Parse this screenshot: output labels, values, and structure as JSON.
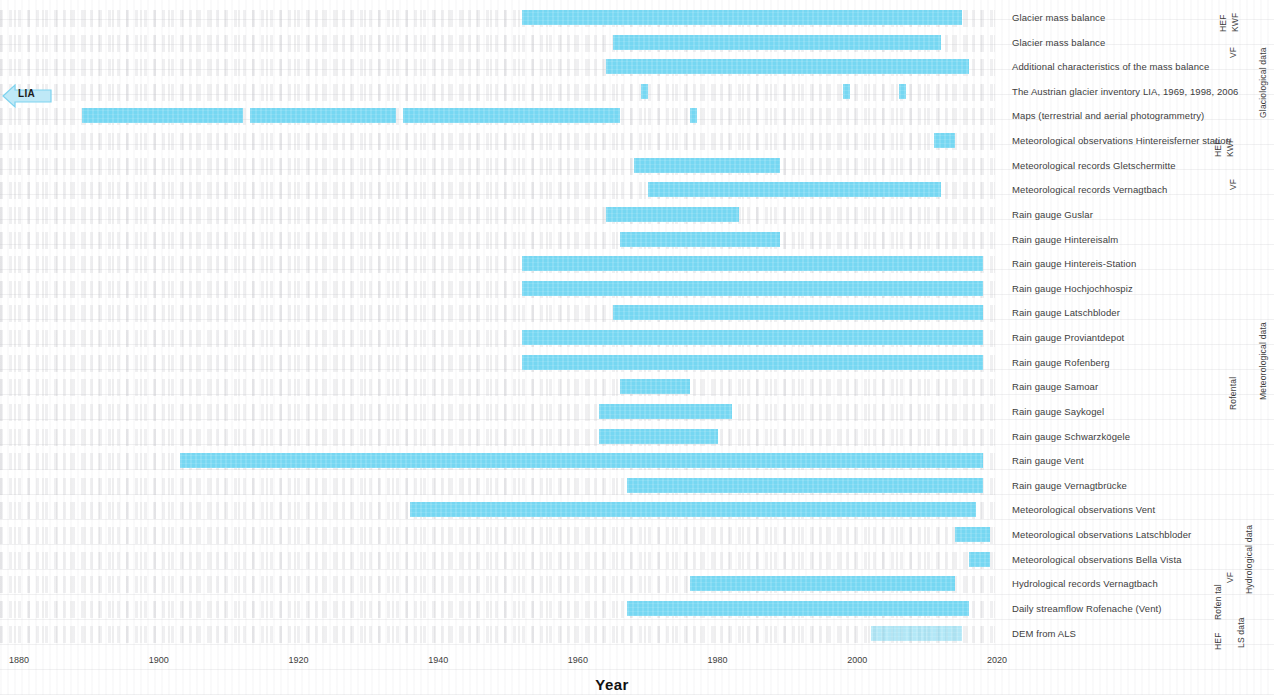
{
  "chart_data": {
    "type": "bar",
    "subtype": "timeline-gantt",
    "title": "",
    "xlabel": "Year",
    "ylabel": "",
    "xlim": [
      1876,
      2022
    ],
    "xticks": [
      1880,
      1900,
      1920,
      1940,
      1960,
      1980,
      2000,
      2020
    ],
    "grid": false,
    "bar_color": "#76d7f2",
    "annotations": [
      {
        "name": "lia-marker",
        "label": "LIA",
        "x_px": 2,
        "y_px": 83,
        "shape": "left-pointing-arrow-tag"
      }
    ],
    "categories": [
      "Glacier mass balance",
      "Glacier mass balance",
      "Additional characteristics of the mass balance",
      "The Austrian glacier inventory LIA, 1969, 1998, 2006",
      "Maps (terrestrial and aerial photogrammetry)",
      "Meteorological observations Hintereisferner station",
      "Meteorological records Gletschermitte",
      "Meteorological records Vernagtbach",
      "Rain gauge Guslar",
      "Rain gauge Hintereisalm",
      "Rain gauge Hintereis-Station",
      "Rain gauge Hochjochhospiz",
      "Rain gauge Latschbloder",
      "Rain gauge Proviantdepot",
      "Rain gauge Rofenberg",
      "Rain gauge Samoar",
      "Rain gauge Saykogel",
      "Rain gauge Schwarzkögele",
      "Rain gauge Vent",
      "Rain gauge Vernagtbrücke",
      "Meteorological observations Vent",
      "Meteorological observations Latschbloder",
      "Meteorological observations Bella Vista",
      "Hydrological records Vernagtbach",
      "Daily streamflow Rofenache (Vent)",
      "DEM from ALS"
    ],
    "rows": [
      {
        "label": "Glacier mass balance",
        "spans": [
          [
            1952,
            2015
          ]
        ]
      },
      {
        "label": "Glacier mass balance",
        "spans": [
          [
            1965,
            2012
          ]
        ]
      },
      {
        "label": "Additional characteristics of the mass balance",
        "spans": [
          [
            1964,
            2016
          ]
        ]
      },
      {
        "label": "The Austrian glacier inventory LIA, 1969, 1998, 2006",
        "spans": [
          [
            1969,
            1970
          ],
          [
            1998,
            1999
          ],
          [
            2006,
            2007
          ]
        ]
      },
      {
        "label": "Maps (terrestrial and aerial photogrammetry)",
        "spans": [
          [
            1889,
            1912
          ],
          [
            1913,
            1934
          ],
          [
            1935,
            1966
          ],
          [
            1976,
            1977
          ]
        ]
      },
      {
        "label": "Meteorological observations Hintereisferner station",
        "spans": [
          [
            2011,
            2014
          ]
        ]
      },
      {
        "label": "Meteorological records Gletschermitte",
        "spans": [
          [
            1968,
            1989
          ]
        ]
      },
      {
        "label": "Meteorological records Vernagtbach",
        "spans": [
          [
            1970,
            2012
          ]
        ]
      },
      {
        "label": "Rain gauge Guslar",
        "spans": [
          [
            1964,
            1983
          ]
        ]
      },
      {
        "label": "Rain gauge Hintereisalm",
        "spans": [
          [
            1966,
            1989
          ]
        ]
      },
      {
        "label": "Rain gauge Hintereis-Station",
        "spans": [
          [
            1952,
            2018
          ]
        ]
      },
      {
        "label": "Rain gauge Hochjochhospiz",
        "spans": [
          [
            1952,
            2018
          ]
        ]
      },
      {
        "label": "Rain gauge Latschbloder",
        "spans": [
          [
            1965,
            2018
          ]
        ]
      },
      {
        "label": "Rain gauge Proviantdepot",
        "spans": [
          [
            1952,
            2018
          ]
        ]
      },
      {
        "label": "Rain gauge Rofenberg",
        "spans": [
          [
            1952,
            2018
          ]
        ]
      },
      {
        "label": "Rain gauge Samoar",
        "spans": [
          [
            1966,
            1976
          ]
        ]
      },
      {
        "label": "Rain gauge Saykogel",
        "spans": [
          [
            1963,
            1982
          ]
        ]
      },
      {
        "label": "Rain gauge Schwarzkögele",
        "spans": [
          [
            1963,
            1980
          ]
        ]
      },
      {
        "label": "Rain gauge Vent",
        "spans": [
          [
            1903,
            2018
          ]
        ]
      },
      {
        "label": "Rain gauge Vernagtbrücke",
        "spans": [
          [
            1967,
            2018
          ]
        ]
      },
      {
        "label": "Meteorological observations Vent",
        "spans": [
          [
            1936,
            2017
          ]
        ]
      },
      {
        "label": "Meteorological observations Latschbloder",
        "spans": [
          [
            2014,
            2019
          ]
        ]
      },
      {
        "label": "Meteorological observations Bella Vista",
        "spans": [
          [
            2016,
            2019
          ]
        ]
      },
      {
        "label": "Hydrological records Vernagtbach",
        "spans": [
          [
            1976,
            2014
          ]
        ]
      },
      {
        "label": "Daily streamflow Rofenache (Vent)",
        "spans": [
          [
            1967,
            2016
          ]
        ]
      },
      {
        "label": "DEM from ALS",
        "spans": [
          [
            2002,
            2015
          ]
        ]
      }
    ],
    "group_labels_inner": [
      {
        "text": "HEF",
        "rows": [
          0
        ]
      },
      {
        "text": "KWF",
        "rows": [
          0
        ]
      },
      {
        "text": "VF",
        "rows": [
          1,
          2
        ]
      },
      {
        "text": "HEF",
        "rows": [
          5
        ]
      },
      {
        "text": "KWF",
        "rows": [
          5
        ]
      },
      {
        "text": "VF",
        "rows": [
          6,
          7
        ]
      },
      {
        "text": "Rofental",
        "rows": [
          8,
          19
        ]
      },
      {
        "text": "VF",
        "rows": [
          23
        ]
      },
      {
        "text": "Rofental",
        "rows": [
          24
        ]
      },
      {
        "text": "HEF",
        "rows": [
          25
        ]
      }
    ],
    "group_labels_outer": [
      {
        "text": "Glaciological data"
      },
      {
        "text": "Meteorological data"
      },
      {
        "text": "Hydrological data"
      },
      {
        "text": "LS data"
      }
    ]
  },
  "axis": {
    "title": "Year",
    "ticks": [
      "1880",
      "1900",
      "1920",
      "1940",
      "1960",
      "1980",
      "2000",
      "2020"
    ]
  },
  "marker": {
    "lia_label": "LIA"
  },
  "labels": {
    "r0": "Glacier mass balance",
    "r1": "Glacier mass balance",
    "r2": "Additional characteristics of the mass balance",
    "r3": "The Austrian glacier inventory LIA, 1969, 1998, 2006",
    "r4": "Maps (terrestrial and aerial photogrammetry)",
    "r5": "Meteorological observations Hintereisferner station",
    "r6": "Meteorological records Gletschermitte",
    "r7": "Meteorological records Vernagtbach",
    "r8": "Rain gauge Guslar",
    "r9": "Rain gauge Hintereisalm",
    "r10": "Rain gauge Hintereis-Station",
    "r11": "Rain gauge Hochjochhospiz",
    "r12": "Rain gauge Latschbloder",
    "r13": "Rain gauge Proviantdepot",
    "r14": "Rain gauge Rofenberg",
    "r15": "Rain gauge Samoar",
    "r16": "Rain gauge Saykogel",
    "r17": "Rain gauge Schwarzkögele",
    "r18": "Rain gauge Vent",
    "r19": "Rain gauge Vernagtbrücke",
    "r20": "Meteorological observations Vent",
    "r21": "Meteorological observations Latschbloder",
    "r22": "Meteorological observations Bella Vista",
    "r23": "Hydrological records Vernagtbach",
    "r24": "Daily streamflow Rofenache (Vent)",
    "r25": "DEM from ALS"
  },
  "side": {
    "hef_top": "HEF",
    "kwf_top": "KWF",
    "vf_top": "VF",
    "glaciological": "Glaciological data",
    "hef_mid": "HEF",
    "kwf_mid": "KWF",
    "vf_mid": "VF",
    "rofental": "Rofental",
    "meteorological": "Meteorological data",
    "vf_hyd": "VF",
    "rofental_hyd": "Rofen tal",
    "hydrological": "Hydrological data",
    "hef_bot": "HEF",
    "ls_data": "LS data"
  }
}
